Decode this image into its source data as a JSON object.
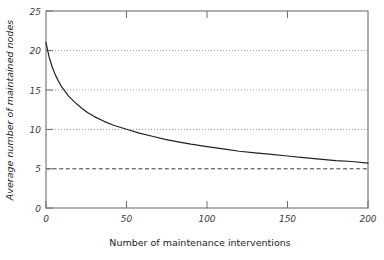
{
  "chart_data": {
    "type": "line",
    "title": "",
    "xlabel": "Number of maintenance interventions",
    "ylabel": "Average number of maintained nodes",
    "xlim": [
      0,
      200
    ],
    "ylim": [
      0,
      25
    ],
    "xticks": [
      0,
      50,
      100,
      150,
      200
    ],
    "yticks": [
      0,
      5,
      10,
      15,
      20,
      25
    ],
    "xtick_labels": [
      "0",
      "50",
      "100",
      "150",
      "200"
    ],
    "ytick_labels": [
      "0",
      "5",
      "10",
      "15",
      "20",
      "25"
    ],
    "grid": "horizontal dotted gridlines at y = 10, 15, 20",
    "gridlines": [
      10,
      15,
      20
    ],
    "legend": "none",
    "series": [
      {
        "name": "Average number of maintained nodes",
        "style": "solid",
        "color": "#222222",
        "x": [
          0,
          2,
          4,
          6,
          8,
          10,
          14,
          18,
          22,
          26,
          30,
          36,
          42,
          50,
          58,
          66,
          74,
          82,
          90,
          100,
          110,
          120,
          130,
          140,
          150,
          160,
          170,
          180,
          190,
          200
        ],
        "values": [
          21.0,
          19.1,
          17.8,
          16.8,
          16.0,
          15.3,
          14.2,
          13.4,
          12.7,
          12.1,
          11.6,
          11.0,
          10.5,
          10.0,
          9.5,
          9.1,
          8.7,
          8.4,
          8.1,
          7.8,
          7.5,
          7.2,
          7.0,
          6.8,
          6.6,
          6.4,
          6.2,
          6.0,
          5.9,
          5.7
        ]
      },
      {
        "name": "asymptote",
        "style": "dashed",
        "color": "#333333",
        "x": [
          0,
          200
        ],
        "values": [
          5,
          5
        ]
      }
    ],
    "annotations": [
      "Curve starts near 21 at x = 0 and decays monotonically toward the dashed asymptote at y = 5",
      "Curve crosses y = 20 just after x = 0",
      "Curve crosses y = 15 near x = 12",
      "Curve crosses y = 10 near x = 52"
    ]
  },
  "axes": {
    "y_title": "Average number of maintained nodes",
    "x_title": "Number of maintenance interventions"
  },
  "ticks": {
    "y": [
      "25",
      "20",
      "15",
      "10",
      "5",
      "0"
    ],
    "x": [
      "0",
      "50",
      "100",
      "150",
      "200"
    ]
  }
}
